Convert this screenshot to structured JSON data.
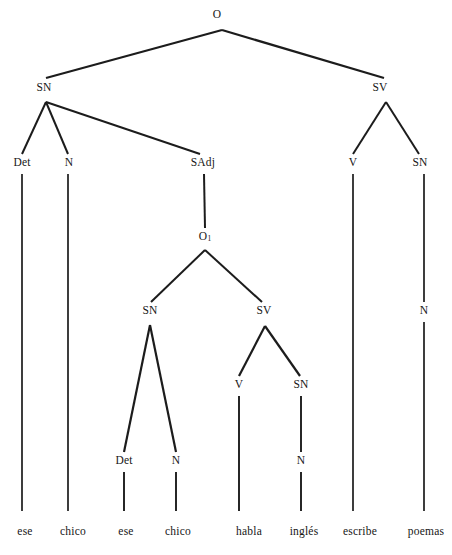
{
  "diagram": {
    "type": "constituency-tree",
    "language": "es",
    "sentence": "ese chico ese chico habla inglés escribe poemas",
    "background_color": "#ffffff",
    "line_color": "#1c1c1c"
  },
  "nodes": {
    "root": {
      "label": "O",
      "x": 217,
      "y": 15
    },
    "sn_top": {
      "label": "SN",
      "x": 44,
      "y": 88
    },
    "sv_top": {
      "label": "SV",
      "x": 380,
      "y": 88
    },
    "det_top": {
      "label": "Det",
      "x": 22,
      "y": 163
    },
    "n_top": {
      "label": "N",
      "x": 69,
      "y": 163
    },
    "sadj": {
      "label": "SAdj",
      "x": 203,
      "y": 163
    },
    "v_top": {
      "label": "V",
      "x": 353,
      "y": 163
    },
    "sn_right": {
      "label": "SN",
      "x": 420,
      "y": 163
    },
    "o_sub": {
      "label": "O",
      "sub": "1",
      "x": 205,
      "y": 237
    },
    "sn_mid": {
      "label": "SN",
      "x": 150,
      "y": 311
    },
    "sv_mid": {
      "label": "SV",
      "x": 264,
      "y": 311
    },
    "n_right": {
      "label": "N",
      "x": 424,
      "y": 311
    },
    "v_mid": {
      "label": "V",
      "x": 239,
      "y": 385
    },
    "sn_inner": {
      "label": "SN",
      "x": 301,
      "y": 385
    },
    "det_mid": {
      "label": "Det",
      "x": 124,
      "y": 461
    },
    "n_mid": {
      "label": "N",
      "x": 176,
      "y": 461
    },
    "n_inner": {
      "label": "N",
      "x": 301,
      "y": 461
    }
  },
  "terminals": [
    {
      "label": "ese",
      "x": 25,
      "y": 532
    },
    {
      "label": "chico",
      "x": 73,
      "y": 532
    },
    {
      "label": "ese",
      "x": 126,
      "y": 532
    },
    {
      "label": "chico",
      "x": 178,
      "y": 532
    },
    {
      "label": "habla",
      "x": 249,
      "y": 532
    },
    {
      "label": "inglés",
      "x": 304,
      "y": 532
    },
    {
      "label": "escribe",
      "x": 360,
      "y": 532
    },
    {
      "label": "poemas",
      "x": 426,
      "y": 532
    }
  ],
  "edges": [
    {
      "name": "root-to-sn",
      "x1": 222,
      "y1": 30,
      "x2": 46,
      "y2": 78,
      "w": 2.2
    },
    {
      "name": "root-to-sv",
      "x1": 222,
      "y1": 30,
      "x2": 384,
      "y2": 78,
      "w": 2.2
    },
    {
      "name": "sn-to-det",
      "x1": 46,
      "y1": 102,
      "x2": 22,
      "y2": 154,
      "w": 2.0
    },
    {
      "name": "sn-to-n",
      "x1": 46,
      "y1": 102,
      "x2": 68,
      "y2": 154,
      "w": 2.0
    },
    {
      "name": "sn-to-sadj",
      "x1": 46,
      "y1": 102,
      "x2": 200,
      "y2": 154,
      "w": 2.0
    },
    {
      "name": "sv-to-v",
      "x1": 386,
      "y1": 102,
      "x2": 353,
      "y2": 154,
      "w": 2.0
    },
    {
      "name": "sv-to-sn",
      "x1": 386,
      "y1": 102,
      "x2": 419,
      "y2": 154,
      "w": 2.0
    },
    {
      "name": "sadj-to-o1",
      "x1": 204,
      "y1": 174,
      "x2": 205,
      "y2": 228,
      "w": 2.0
    },
    {
      "name": "o1-to-sn",
      "x1": 205,
      "y1": 250,
      "x2": 151,
      "y2": 302,
      "w": 2.0
    },
    {
      "name": "o1-to-sv",
      "x1": 205,
      "y1": 250,
      "x2": 262,
      "y2": 302,
      "w": 2.0
    },
    {
      "name": "snmid-to-det",
      "x1": 150,
      "y1": 325,
      "x2": 124,
      "y2": 452,
      "w": 2.2
    },
    {
      "name": "snmid-to-n",
      "x1": 150,
      "y1": 325,
      "x2": 176,
      "y2": 452,
      "w": 2.2
    },
    {
      "name": "svmid-to-v",
      "x1": 265,
      "y1": 326,
      "x2": 239,
      "y2": 376,
      "w": 2.2
    },
    {
      "name": "svmid-to-sn",
      "x1": 265,
      "y1": 326,
      "x2": 300,
      "y2": 376,
      "w": 2.2
    },
    {
      "name": "det-top-stem",
      "x1": 22,
      "y1": 174,
      "x2": 22,
      "y2": 511,
      "w": 1.7
    },
    {
      "name": "n-top-stem",
      "x1": 68,
      "y1": 174,
      "x2": 68,
      "y2": 511,
      "w": 1.7
    },
    {
      "name": "v-top-stem",
      "x1": 353,
      "y1": 174,
      "x2": 353,
      "y2": 511,
      "w": 1.7
    },
    {
      "name": "snright-to-n",
      "x1": 424,
      "y1": 174,
      "x2": 424,
      "y2": 302,
      "w": 1.7
    },
    {
      "name": "nright-stem",
      "x1": 424,
      "y1": 322,
      "x2": 424,
      "y2": 511,
      "w": 1.7
    },
    {
      "name": "det-mid-stem",
      "x1": 124,
      "y1": 472,
      "x2": 124,
      "y2": 511,
      "w": 1.9
    },
    {
      "name": "n-mid-stem",
      "x1": 176,
      "y1": 472,
      "x2": 176,
      "y2": 511,
      "w": 1.9
    },
    {
      "name": "v-mid-stem",
      "x1": 239,
      "y1": 396,
      "x2": 239,
      "y2": 511,
      "w": 1.9
    },
    {
      "name": "sninner-to-n",
      "x1": 301,
      "y1": 396,
      "x2": 301,
      "y2": 452,
      "w": 1.9
    },
    {
      "name": "ninner-stem",
      "x1": 301,
      "y1": 472,
      "x2": 301,
      "y2": 511,
      "w": 1.9
    }
  ]
}
